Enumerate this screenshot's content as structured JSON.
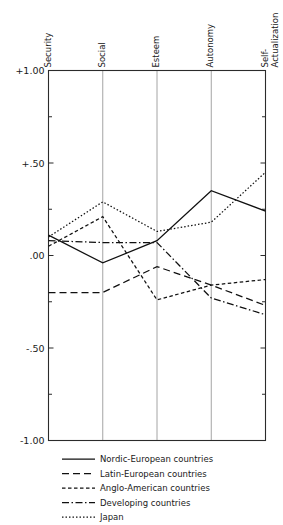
{
  "chart_data": {
    "type": "line",
    "title": "",
    "subtitle": "",
    "xlabel": "",
    "ylabel": "",
    "categories": [
      "Security",
      "Social",
      "Esteem",
      "Autonomy",
      "Self-Actualization"
    ],
    "category_labels_multiline": [
      [
        "Security"
      ],
      [
        "Social"
      ],
      [
        "Esteem"
      ],
      [
        "Autonomy"
      ],
      [
        "Self-",
        "Actualization"
      ]
    ],
    "ylim": [
      -1.0,
      1.0
    ],
    "yticks": [
      1.0,
      0.5,
      0.0,
      -0.5,
      -1.0
    ],
    "ytick_labels": [
      "+1.00",
      "+.50",
      ".00",
      "-.50",
      "-1.00"
    ],
    "yminor_ticks": [
      0.75,
      0.25,
      -0.25,
      -0.75
    ],
    "grid": "vertical-only",
    "legend_position": "below-plot-left",
    "axis_position": "x-axis-on-top",
    "series": [
      {
        "name": "Nordic-European countries",
        "linestyle": "solid",
        "dash": "none",
        "values": [
          0.11,
          -0.04,
          0.08,
          0.35,
          0.24
        ]
      },
      {
        "name": "Latin-European countries",
        "linestyle": "long-dash",
        "dash": "7,4",
        "values": [
          -0.2,
          -0.2,
          -0.06,
          -0.16,
          -0.27
        ]
      },
      {
        "name": "Anglo-American countries",
        "linestyle": "short-dash",
        "dash": "3.5,2.5",
        "values": [
          0.05,
          0.21,
          -0.24,
          -0.16,
          -0.13
        ]
      },
      {
        "name": "Developing countries",
        "linestyle": "dash-dot",
        "dash": "7,2.5,1.5,2.5",
        "values": [
          0.08,
          0.07,
          0.07,
          -0.23,
          -0.32
        ]
      },
      {
        "name": "Japan",
        "linestyle": "dotted",
        "dash": "1.5,2",
        "values": [
          0.1,
          0.29,
          0.13,
          0.18,
          0.45
        ]
      }
    ]
  },
  "legend": {
    "entries": [
      {
        "label": "Nordic-European countries"
      },
      {
        "label": "Latin-European countries"
      },
      {
        "label": "Anglo-American countries"
      },
      {
        "label": "Developing countries"
      },
      {
        "label": "Japan"
      }
    ]
  },
  "colors": {
    "line": "#101010",
    "frame": "#2b2b2b",
    "grid": "#8d8d8d",
    "background": "#ffffff"
  }
}
